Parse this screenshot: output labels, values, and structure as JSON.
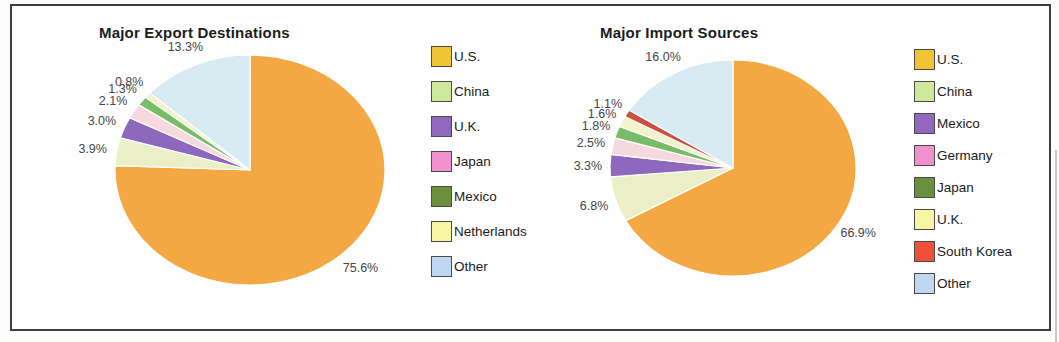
{
  "chart_data": [
    {
      "type": "pie",
      "title": "Major Export Destinations",
      "unit": "%",
      "start_angle_deg": 0,
      "direction": "clockwise",
      "legend_position": "right",
      "segments": [
        {
          "label": "U.S.",
          "value": 75.6,
          "display": "75.6%",
          "slice_color": "#F4A843",
          "legend_color": "#F0C434"
        },
        {
          "label": "China",
          "value": 3.9,
          "display": "3.9%",
          "slice_color": "#EAEFC5",
          "legend_color": "#CDE89B"
        },
        {
          "label": "U.K.",
          "value": 3.0,
          "display": "3.0%",
          "slice_color": "#8D68BC",
          "legend_color": "#9268BE"
        },
        {
          "label": "Japan",
          "value": 2.1,
          "display": "2.1%",
          "slice_color": "#F6D9DE",
          "legend_color": "#F091CE"
        },
        {
          "label": "Mexico",
          "value": 1.3,
          "display": "1.3%",
          "slice_color": "#79BC68",
          "legend_color": "#6A8F3D"
        },
        {
          "label": "Netherlands",
          "value": 0.8,
          "display": "0.8%",
          "slice_color": "#F2F2CB",
          "legend_color": "#F8F6A2"
        },
        {
          "label": "Other",
          "value": 13.3,
          "display": "13.3%",
          "slice_color": "#D9EBF2",
          "legend_color": "#BFD7F0"
        }
      ]
    },
    {
      "type": "pie",
      "title": "Major Import Sources",
      "unit": "%",
      "start_angle_deg": 0,
      "direction": "clockwise",
      "legend_position": "right",
      "segments": [
        {
          "label": "U.S.",
          "value": 66.9,
          "display": "66.9%",
          "slice_color": "#F4A843",
          "legend_color": "#F0C434"
        },
        {
          "label": "China",
          "value": 6.8,
          "display": "6.8%",
          "slice_color": "#EAEFC5",
          "legend_color": "#CDE89B"
        },
        {
          "label": "Mexico",
          "value": 3.3,
          "display": "3.3%",
          "slice_color": "#8D68BC",
          "legend_color": "#9268BE"
        },
        {
          "label": "Germany",
          "value": 2.5,
          "display": "2.5%",
          "slice_color": "#F6D9DE",
          "legend_color": "#F091CE"
        },
        {
          "label": "Japan",
          "value": 1.8,
          "display": "1.8%",
          "slice_color": "#79BC68",
          "legend_color": "#6A8F3D"
        },
        {
          "label": "U.K.",
          "value": 1.6,
          "display": "1.6%",
          "slice_color": "#F2F2CB",
          "legend_color": "#F8F6A2"
        },
        {
          "label": "South Korea",
          "value": 1.1,
          "display": "1.1%",
          "slice_color": "#CB5140",
          "legend_color": "#F05038"
        },
        {
          "label": "Other",
          "value": 16.0,
          "display": "16.0%",
          "slice_color": "#D9EBF2",
          "legend_color": "#BFD7F0"
        }
      ]
    }
  ]
}
